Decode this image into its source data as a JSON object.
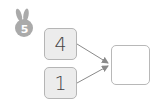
{
  "badge": {
    "icon": "rabbit-icon",
    "number": "5",
    "color": "#aaaaaa"
  },
  "inputs": [
    {
      "value": "4"
    },
    {
      "value": "1"
    }
  ],
  "output": {
    "value": ""
  },
  "colors": {
    "input_fill": "#ececec",
    "border": "#b5b5b5",
    "arrow": "#8a8a8a"
  }
}
